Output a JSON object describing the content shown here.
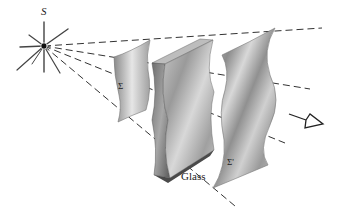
{
  "diagram": {
    "type": "wavefront-refraction-illustration",
    "source": {
      "label": "S",
      "position": [
        44,
        46
      ]
    },
    "wavefronts": [
      {
        "label": "Σ",
        "description": "spherical wavefront before glass"
      },
      {
        "label": "Σ'",
        "description": "distorted wavefront after passing through glass"
      }
    ],
    "elements": [
      {
        "label": "Glass",
        "description": "glass slab with irregular surface"
      }
    ],
    "rays": 4,
    "observer": "eye-arrow",
    "colors": {
      "line": "#333333",
      "surface": "#9a9a9a",
      "background": "#ffffff"
    }
  },
  "labels": {
    "source": "S",
    "sigma": "Σ",
    "sigma_prime": "Σ'",
    "glass": "Glass"
  }
}
